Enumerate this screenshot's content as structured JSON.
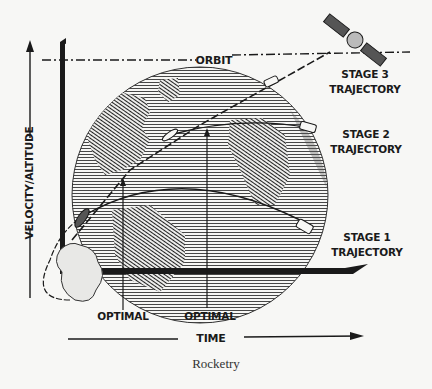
{
  "diagram": {
    "title": "Rocketry",
    "y_axis_label": "VELOCITY/ALTITUDE",
    "x_axis_label": "TIME",
    "orbit_label": "ORBIT",
    "stages": [
      {
        "line1": "STAGE 3",
        "line2": "TRAJECTORY"
      },
      {
        "line1": "STAGE 2",
        "line2": "TRAJECTORY"
      },
      {
        "line1": "STAGE 1",
        "line2": "TRAJECTORY"
      }
    ],
    "markers": [
      {
        "label": "OPTIMAL"
      },
      {
        "label": "OPTIMAL"
      }
    ],
    "colors": {
      "ink": "#1a1a1a",
      "paper": "#f7f7f5",
      "globe_shade": "#555555"
    }
  }
}
